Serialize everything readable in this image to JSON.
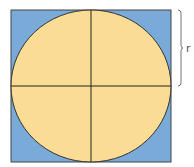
{
  "diagram": {
    "square": {
      "x": 11,
      "y": 10,
      "width": 160,
      "height": 152,
      "fill": "#7aaad8",
      "stroke": "#444444"
    },
    "circle": {
      "cx": 91,
      "cy": 86,
      "rx": 80,
      "ry": 76,
      "fill": "#fbdc94",
      "stroke": "#333333"
    },
    "radius_label": "r",
    "bracket": {
      "x": 181,
      "y1": 10,
      "y2": 86,
      "color": "#777777"
    }
  }
}
